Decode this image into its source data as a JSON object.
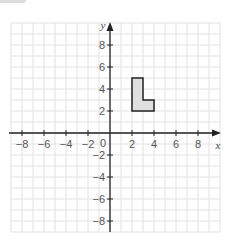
{
  "chart_data": {
    "type": "scatter",
    "title": "",
    "xlabel": "x",
    "ylabel": "y",
    "xlim": [
      -9,
      10
    ],
    "ylim": [
      -9,
      10
    ],
    "grid": true,
    "x_ticks": [
      "−8",
      "−6",
      "−4",
      "−2",
      "2",
      "4",
      "6",
      "8"
    ],
    "y_ticks": [
      "8",
      "6",
      "4",
      "2",
      "−2",
      "−4",
      "−6",
      "−8"
    ],
    "origin_label": "0",
    "shapes": [
      {
        "name": "L-shape",
        "fill": "#e0e0e0",
        "stroke": "#222",
        "vertices": [
          [
            2,
            2
          ],
          [
            2,
            5
          ],
          [
            3,
            5
          ],
          [
            3,
            3
          ],
          [
            4,
            3
          ],
          [
            4,
            2
          ]
        ]
      }
    ]
  }
}
